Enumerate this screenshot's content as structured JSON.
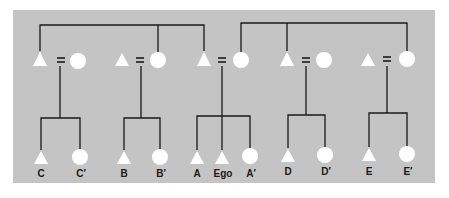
{
  "diagram": {
    "type": "kinship-chart",
    "colors": {
      "background": "#ffffff",
      "panel": "#c4c4c4",
      "line": "#1a1a1a",
      "symbol": "#ffffff",
      "label": "#1a1a1a"
    },
    "symbols": {
      "male": "triangle",
      "female": "circle",
      "marriage": "="
    },
    "marriage_sign": "=",
    "families": [
      {
        "id": "family-c",
        "husband_x": 40,
        "wife_x": 78,
        "equals_x": 61,
        "children": [
          {
            "sex": "male",
            "label": "C",
            "x": 41
          },
          {
            "sex": "female",
            "label": "C′",
            "x": 80
          }
        ]
      },
      {
        "id": "family-b",
        "husband_x": 122,
        "wife_x": 158,
        "equals_x": 141,
        "children": [
          {
            "sex": "male",
            "label": "B",
            "x": 124
          },
          {
            "sex": "female",
            "label": "B′",
            "x": 160
          }
        ]
      },
      {
        "id": "family-ego",
        "husband_x": 204,
        "wife_x": 241,
        "equals_x": 222,
        "children": [
          {
            "sex": "male",
            "label": "A",
            "x": 197
          },
          {
            "sex": "male",
            "label": "Ego",
            "x": 222
          },
          {
            "sex": "female",
            "label": "A′",
            "x": 250
          }
        ]
      },
      {
        "id": "family-d",
        "husband_x": 287,
        "wife_x": 324,
        "equals_x": 306,
        "children": [
          {
            "sex": "male",
            "label": "D",
            "x": 288
          },
          {
            "sex": "female",
            "label": "D′",
            "x": 325
          }
        ]
      },
      {
        "id": "family-e",
        "husband_x": 368,
        "wife_x": 407,
        "equals_x": 387,
        "children": [
          {
            "sex": "male",
            "label": "E",
            "x": 369
          },
          {
            "sex": "female",
            "label": "E′",
            "x": 407
          }
        ]
      }
    ],
    "sibling_sets_top": [
      {
        "description": "father's sibling set (C's father, B's mother, Ego's father)",
        "members": [
          "family-c.husband",
          "family-b.wife",
          "family-ego.husband"
        ]
      },
      {
        "description": "mother's sibling set (Ego's mother, D's father, E's mother)",
        "members": [
          "family-ego.wife",
          "family-d.husband",
          "family-e.wife"
        ]
      }
    ],
    "labels": [
      "C",
      "C′",
      "B",
      "B′",
      "A",
      "Ego",
      "A′",
      "D",
      "D′",
      "E",
      "E′"
    ]
  }
}
